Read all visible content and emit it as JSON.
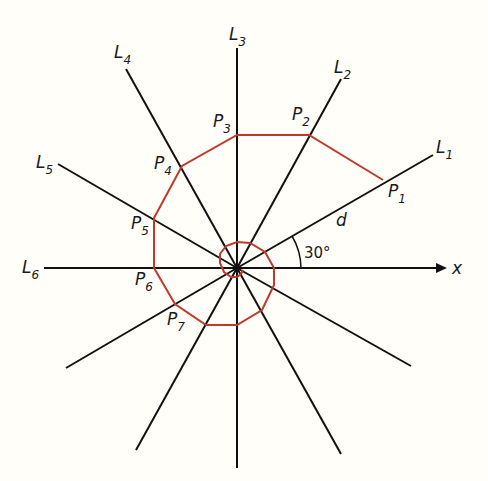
{
  "figure": {
    "center": [
      237,
      268
    ],
    "line_color": "#111111",
    "polygon_color": "#c0392b",
    "lines": [
      {
        "name": "L1",
        "sub": "1",
        "angle_deg": 30
      },
      {
        "name": "L2",
        "sub": "2",
        "angle_deg": 60
      },
      {
        "name": "L3",
        "sub": "3",
        "angle_deg": 90
      },
      {
        "name": "L4",
        "sub": "4",
        "angle_deg": 120
      },
      {
        "name": "L5",
        "sub": "5",
        "angle_deg": 150
      },
      {
        "name": "L6",
        "sub": "6",
        "angle_deg": 180
      }
    ],
    "points": [
      {
        "name": "P1",
        "sub": "1"
      },
      {
        "name": "P2",
        "sub": "2"
      },
      {
        "name": "P3",
        "sub": "3"
      },
      {
        "name": "P4",
        "sub": "4"
      },
      {
        "name": "P5",
        "sub": "5"
      },
      {
        "name": "P6",
        "sub": "6"
      },
      {
        "name": "P7",
        "sub": "7"
      }
    ],
    "labels": {
      "L": "L",
      "P": "P",
      "distance": "d",
      "angle": "30°",
      "axis": "x"
    }
  }
}
